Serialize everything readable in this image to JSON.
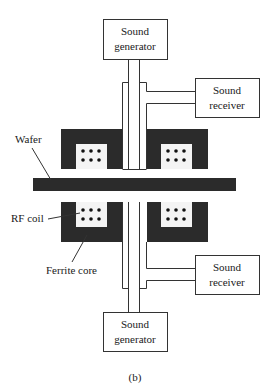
{
  "figure": {
    "caption": "(b)",
    "colors": {
      "ferrite": "#2b2b2b",
      "wafer": "#2b2b2b",
      "outline": "#333333",
      "background": "#ffffff"
    }
  },
  "components": {
    "top_generator": {
      "line1": "Sound",
      "line2": "generator"
    },
    "bottom_generator": {
      "line1": "Sound",
      "line2": "generator"
    },
    "top_receiver": {
      "line1": "Sound",
      "line2": "receiver"
    },
    "bottom_receiver": {
      "line1": "Sound",
      "line2": "receiver"
    }
  },
  "labels": {
    "wafer": "Wafer",
    "rf_coil": "RF coil",
    "ferrite_core": "Ferrite core"
  }
}
